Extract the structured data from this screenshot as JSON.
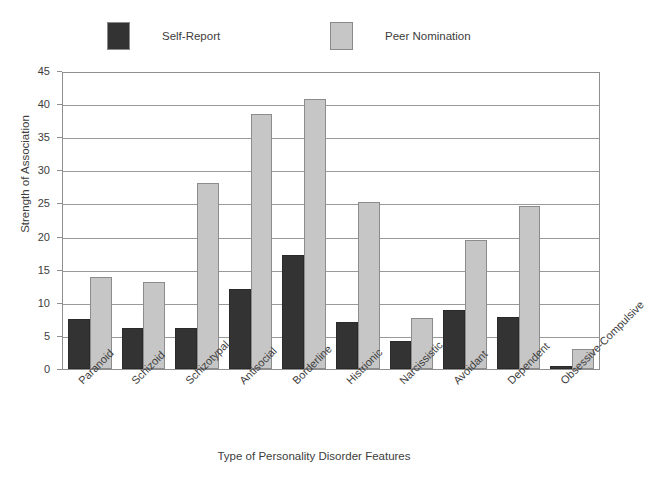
{
  "chart_data": {
    "type": "bar",
    "title": "",
    "xlabel": "Type of Personality Disorder Features",
    "ylabel": "Strength of Association",
    "ylim": [
      0,
      45
    ],
    "ytick_step": 5,
    "yticks": [
      "0",
      "5",
      "10",
      "15",
      "20",
      "25",
      "30",
      "35",
      "40",
      "45"
    ],
    "grid": true,
    "legend_position": "top",
    "categories": [
      "Paranoid",
      "Schizoid",
      "Schizotypal",
      "Antisocial",
      "Borderline",
      "Histrionic",
      "Narcissistic",
      "Avoidant",
      "Dependent",
      "Obsessive-Compulsive"
    ],
    "series": [
      {
        "name": "Self-Report",
        "color": "#333333",
        "values": [
          7.6,
          6.2,
          6.2,
          12.1,
          17.3,
          7.1,
          4.3,
          9.0,
          7.9,
          0.5
        ]
      },
      {
        "name": "Peer Nomination",
        "color": "#c6c6c6",
        "values": [
          14.0,
          13.3,
          28.3,
          38.7,
          41.0,
          25.4,
          7.7,
          19.6,
          24.8,
          3.1
        ]
      }
    ]
  },
  "legend": {
    "entries": [
      {
        "label": "Self-Report",
        "color": "#333333"
      },
      {
        "label": "Peer Nomination",
        "color": "#c6c6c6"
      }
    ]
  },
  "axes": {
    "y_title": "Strength of Association",
    "x_title": "Type of Personality Disorder Features"
  }
}
